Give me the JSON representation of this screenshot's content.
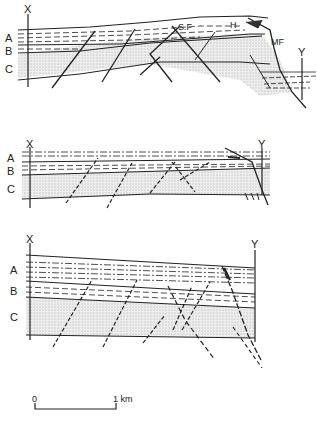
{
  "figure": {
    "type": "geological cross-sections",
    "sections": [
      {
        "id": "section-1",
        "endpoints": {
          "left": "X",
          "right": "Y"
        },
        "layers": [
          "A",
          "B",
          "C"
        ],
        "annotations": [
          "S.F",
          "H",
          "MF"
        ]
      },
      {
        "id": "section-2",
        "endpoints": {
          "left": "X",
          "right": "Y"
        },
        "layers": [
          "A",
          "B",
          "C"
        ]
      },
      {
        "id": "section-3",
        "endpoints": {
          "left": "X",
          "right": "Y"
        },
        "layers": [
          "A",
          "B",
          "C"
        ]
      }
    ],
    "scale_bar": {
      "start": "0",
      "end": "1 km"
    }
  },
  "colors": {
    "ink": "#222222",
    "stipple": "#cfcfcf",
    "background": "#ffffff"
  }
}
